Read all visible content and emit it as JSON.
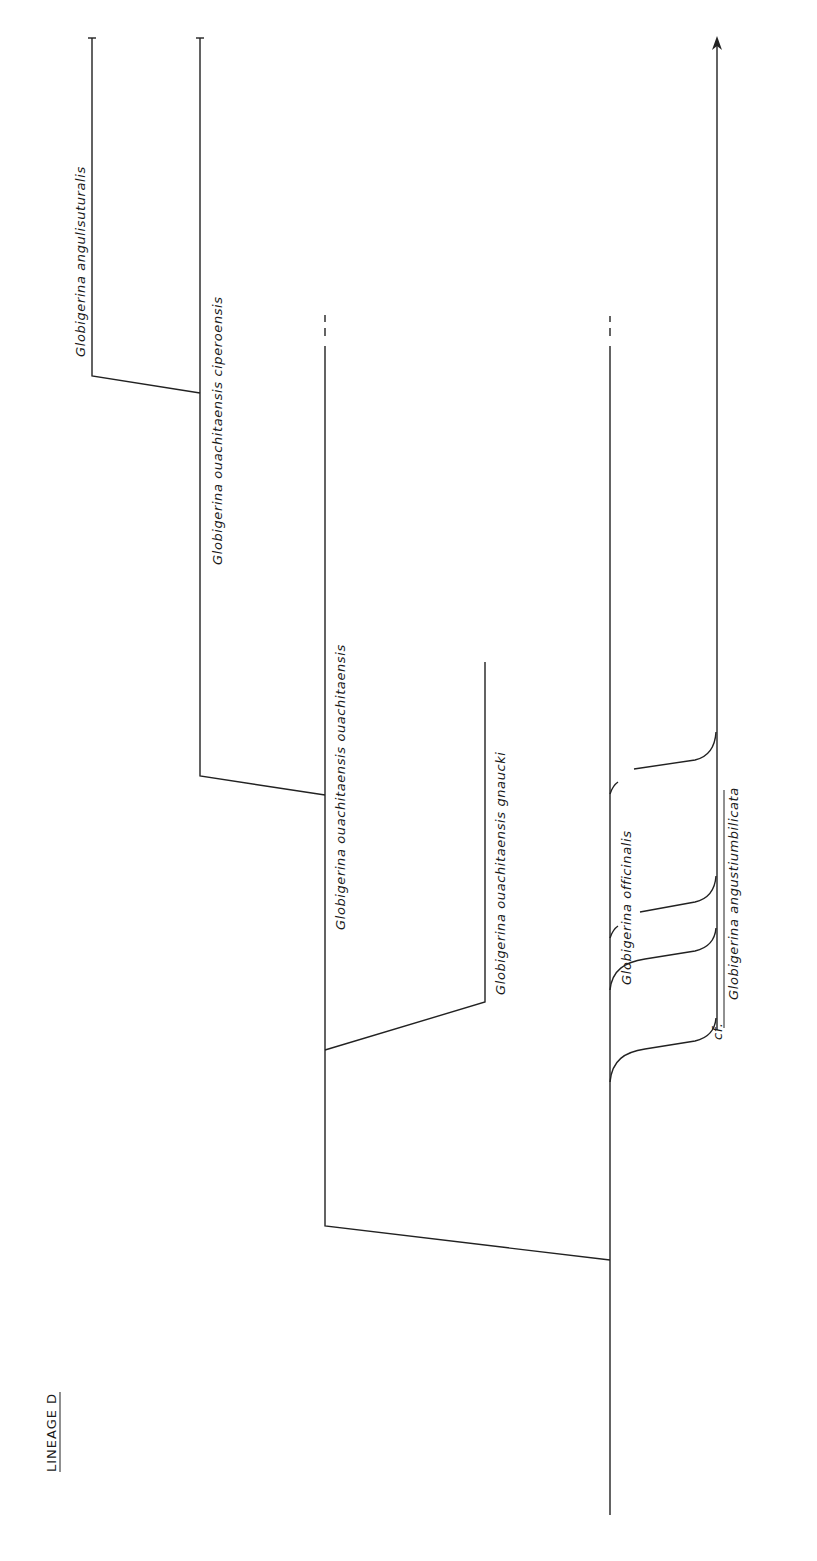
{
  "title": "LINEAGE D",
  "colors": {
    "ink": "#222222",
    "background": "#ffffff"
  },
  "taxa": [
    {
      "id": "angulisuturalis",
      "label": "Globigerina  angulisuturalis"
    },
    {
      "id": "ciperoensis",
      "label": "Globigerina  ouachitaensis  ciperoensis"
    },
    {
      "id": "ouachitaensis",
      "label": "Globigerina ouachitaensis ouachitaensis"
    },
    {
      "id": "gnaucki",
      "label": "Globigerina  ouachitaensis  gnaucki"
    },
    {
      "id": "officinalis",
      "label": "Globigerina  officinalis"
    },
    {
      "id": "angustiumbilicata",
      "label": "Globigerina  angustiumbilicata"
    }
  ],
  "qualifiers": {
    "cf": "cf."
  },
  "features": {
    "arrow": "arrow-up-icon on angustiumbilicata lineage",
    "dashed_tops": [
      "ouachitaensis",
      "officinalis-trunk"
    ],
    "tick_caps": [
      "angulisuturalis",
      "ciperoensis"
    ]
  }
}
